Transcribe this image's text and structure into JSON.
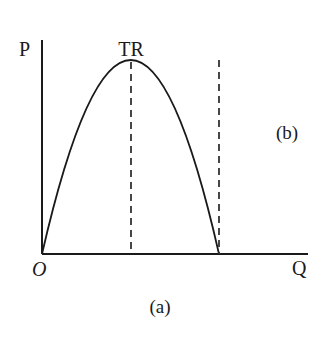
{
  "diagram": {
    "type": "economics-total-revenue-curve",
    "axes": {
      "y_label": "P",
      "x_label": "Q",
      "origin_label": "O"
    },
    "curve": {
      "label": "TR",
      "shape": "inverted-parabola",
      "description": "Total revenue rises from origin to a maximum, then falls back to zero"
    },
    "dashed_lines": [
      {
        "name": "max-tr-line",
        "description": "vertical dashed line at quantity where TR is maximum"
      },
      {
        "name": "zero-tr-line",
        "description": "vertical dashed line at quantity where TR returns to zero"
      }
    ],
    "panel_label_inner": "(b)",
    "caption": "(a)"
  },
  "colors": {
    "line": "#1a1a1a",
    "dashed": "#333333",
    "background": "#ffffff"
  }
}
